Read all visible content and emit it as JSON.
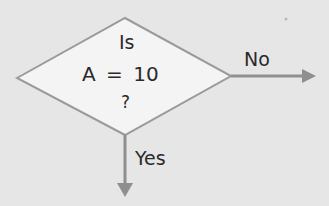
{
  "diagram": {
    "decision": {
      "line1": "Is",
      "line2": "A = 10",
      "line3": "?"
    },
    "branches": {
      "no": "No",
      "yes": "Yes"
    },
    "colors": {
      "background": "#e6e6e6",
      "diamond_fill": "#f4f4f4",
      "stroke": "#9a9a9a",
      "arrow": "#8f8f8f",
      "text": "#2a2a2a"
    }
  }
}
